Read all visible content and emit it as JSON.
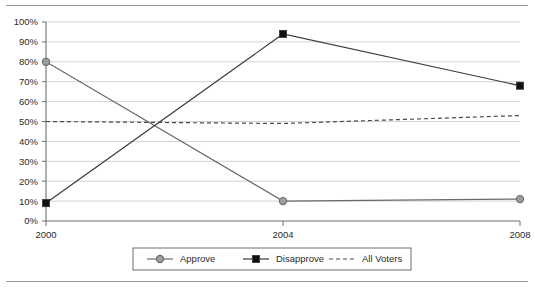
{
  "chart_data": {
    "type": "line",
    "title": "",
    "xlabel": "",
    "ylabel": "",
    "categories": [
      "2000",
      "2004",
      "2008"
    ],
    "x": [
      2000,
      2004,
      2008
    ],
    "ylim": [
      0,
      100
    ],
    "xlim": [
      2000,
      2008
    ],
    "grid": true,
    "grid_axis": "y",
    "legend_position": "bottom",
    "ytick_labels": [
      "0%",
      "10%",
      "20%",
      "30%",
      "40%",
      "50%",
      "60%",
      "70%",
      "80%",
      "90%",
      "100%"
    ],
    "ytick_values": [
      0,
      10,
      20,
      30,
      40,
      50,
      60,
      70,
      80,
      90,
      100
    ],
    "xtick_labels": [
      "2000",
      "2004",
      "2008"
    ],
    "series": [
      {
        "name": "Approve",
        "marker": "circle",
        "line_style": "solid",
        "color": "#6b6b6b",
        "marker_fill": "#9e9e9e",
        "values": [
          80,
          10,
          11
        ]
      },
      {
        "name": "Disapprove",
        "marker": "square",
        "line_style": "solid",
        "color": "#3a3a3a",
        "marker_fill": "#111111",
        "values": [
          9,
          94,
          68
        ]
      },
      {
        "name": "All Voters",
        "marker": "none",
        "line_style": "dashed",
        "color": "#4a4a4a",
        "marker_fill": "none",
        "values": [
          50,
          49,
          53
        ]
      }
    ]
  },
  "legend": {
    "entries": [
      {
        "label": "Approve"
      },
      {
        "label": "Disapprove"
      },
      {
        "label": "All Voters"
      }
    ]
  },
  "colors": {
    "approve": "#6b6b6b",
    "disapprove": "#111111",
    "all_voters": "#4a4a4a",
    "gridline": "#d3d3d3",
    "axis": "#6f6f6f",
    "rule": "#9a9a9a"
  }
}
